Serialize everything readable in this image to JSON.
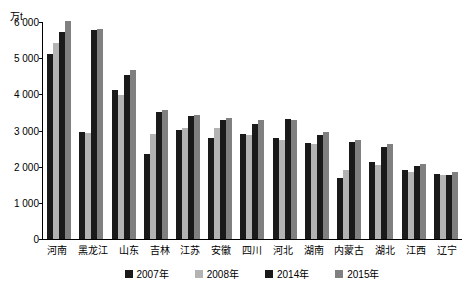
{
  "chart_data": {
    "type": "bar",
    "title": "",
    "subtitle": "",
    "unit_label": "万t",
    "xlabel": "",
    "ylabel": "",
    "ylim": [
      0,
      6000
    ],
    "yticks": [
      0,
      1000,
      2000,
      3000,
      4000,
      5000,
      6000
    ],
    "ytick_labels": [
      "0",
      "1 000",
      "2 000",
      "3 000",
      "4 000",
      "5 000",
      "6 000"
    ],
    "grid": false,
    "legend_position": "bottom",
    "categories": [
      "河南",
      "黑龙江",
      "山东",
      "吉林",
      "江苏",
      "安徽",
      "四川",
      "河北",
      "湖南",
      "内蒙古",
      "湖北",
      "江西",
      "辽宁"
    ],
    "series": [
      {
        "name": "2007年",
        "color": "#1a1a1a",
        "values": [
          5120,
          2950,
          4120,
          2350,
          3020,
          2800,
          2900,
          2800,
          2650,
          1680,
          2120,
          1900,
          1800
        ]
      },
      {
        "name": "2008年",
        "color": "#b3b3b3",
        "values": [
          5430,
          2920,
          3980,
          2900,
          3080,
          3080,
          2880,
          2740,
          2620,
          1920,
          2060,
          1860,
          1780
        ]
      },
      {
        "name": "2014年",
        "color": "#1a1a1a",
        "values": [
          5720,
          5790,
          4540,
          3510,
          3390,
          3280,
          3180,
          3320,
          2880,
          2680,
          2540,
          2020,
          1770
        ]
      },
      {
        "name": "2015年",
        "color": "#808080",
        "values": [
          6020,
          5800,
          4660,
          3580,
          3420,
          3340,
          3300,
          3280,
          2950,
          2730,
          2620,
          2080,
          1840
        ]
      }
    ]
  }
}
